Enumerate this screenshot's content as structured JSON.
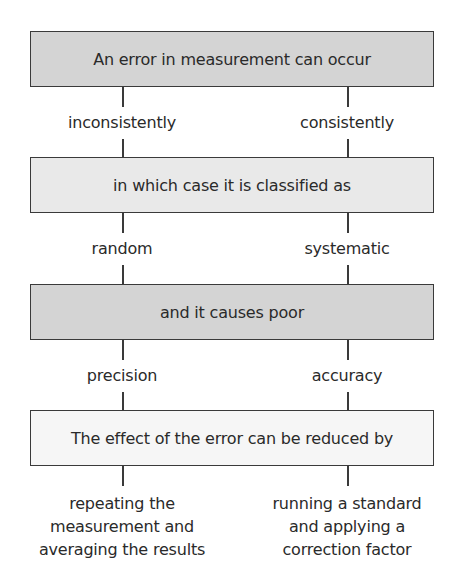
{
  "flowchart": {
    "boxes": [
      {
        "text": "An error in measurement can occur",
        "shade": "dark"
      },
      {
        "text": "in which case it is classified as",
        "shade": "light"
      },
      {
        "text": "and it causes poor",
        "shade": "dark"
      },
      {
        "text": "The effect of the error can be reduced by",
        "shade": "white"
      }
    ],
    "branches": {
      "left": {
        "occurrence": "inconsistently",
        "classification": "random",
        "effect": "precision",
        "reduction": [
          "repeating the",
          "measurement and",
          "averaging the results"
        ]
      },
      "right": {
        "occurrence": "consistently",
        "classification": "systematic",
        "effect": "accuracy",
        "reduction": [
          "running a standard",
          "and applying a",
          "correction factor"
        ]
      }
    }
  },
  "colors": {
    "box_dark": "#d4d4d4",
    "box_light": "#e9e9e9",
    "box_white": "#f6f6f6",
    "line": "#3a3a3a"
  }
}
